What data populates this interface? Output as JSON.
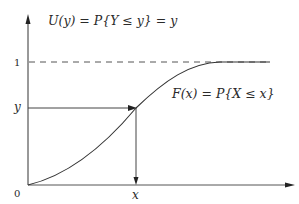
{
  "diagram": {
    "title_formula": "U(y) = P{Y ≤ y} = y",
    "curve_label": "F(x) = P{X ≤ x}",
    "y_axis": {
      "tick_one": "1",
      "tick_y": "y"
    },
    "x_axis": {
      "origin": "0",
      "tick_x": "x"
    },
    "elements": [
      "vertical-axis-with-arrow",
      "horizontal-axis-with-arrow",
      "dashed-asymptote-at-1",
      "cdf-curve",
      "horizontal-arrow-from-y-to-curve",
      "vertical-arrow-from-curve-to-x"
    ],
    "colors": {
      "line": "#333333",
      "dashed": "#555555",
      "background": "#ffffff"
    }
  }
}
